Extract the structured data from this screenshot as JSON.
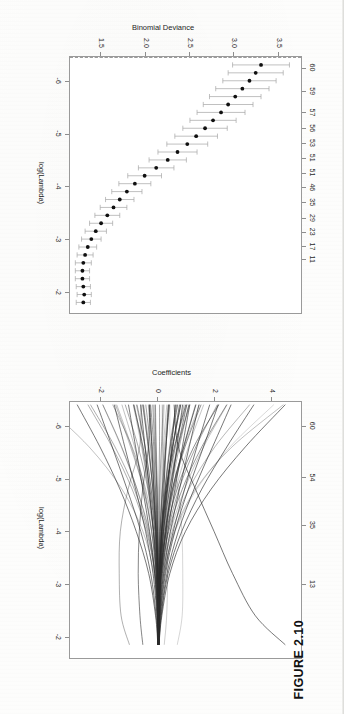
{
  "caption": "FIGURE 2.10",
  "panels": {
    "coefficient_path": {
      "name": "lasso-coefficient-path",
      "xlabel": "log(Lambda)",
      "ylabel": "Coefficients",
      "x_ticks": [
        "-2",
        "-3",
        "-4",
        "-5",
        "-6"
      ],
      "y_ticks": [
        "4",
        "2",
        "0",
        "-2"
      ],
      "top_ticks": [
        "1",
        "13",
        "35",
        "54",
        "60"
      ]
    },
    "cv_curve": {
      "name": "cross-validation-curve",
      "xlabel": "log(Lambda)",
      "ylabel": "Binomial Deviance",
      "x_ticks": [
        "-2",
        "-3",
        "-4",
        "-5",
        "-6"
      ],
      "y_ticks": [
        "3.5",
        "3.0",
        "2.5",
        "2.0",
        "1.5"
      ],
      "top_ticks": [
        "1",
        "4",
        "6",
        "7",
        "11",
        "17",
        "23",
        "29",
        "35",
        "46",
        "51",
        "51",
        "53",
        "56",
        "57",
        "59",
        "60"
      ]
    }
  },
  "chart_data": [
    {
      "type": "line",
      "title": "",
      "xlabel": "log(Lambda)",
      "ylabel": "Coefficients",
      "xlim": [
        -6.45,
        -1.6
      ],
      "ylim": [
        -3.1,
        5.0
      ],
      "grid": false,
      "legend": null,
      "top_axis": {
        "label": "Degrees of Freedom (non-zero coefficients)",
        "tick_positions": [
          -1.85,
          -3.0,
          -4.12,
          -5.02,
          -6.0
        ],
        "tick_labels": [
          "1",
          "13",
          "35",
          "54",
          "60"
        ]
      },
      "x_ticks": [
        -2,
        -3,
        -4,
        -5,
        -6
      ],
      "y_ticks": [
        4,
        2,
        0,
        -2
      ],
      "description": "Lasso regularization paths: 60+ coefficient trajectories converging to zero as log(Lambda) increases.",
      "series": [
        {
          "name": "c1",
          "x": [
            -6.4,
            -5.6,
            -4.8,
            -4.0,
            -3.2,
            -2.4,
            -1.85
          ],
          "values": [
            4.45,
            3.05,
            1.85,
            0.95,
            0.4,
            0.12,
            0.02
          ]
        },
        {
          "name": "c2",
          "x": [
            -6.4,
            -5.6,
            -4.8,
            -4.0,
            -3.2,
            -2.4,
            -1.85
          ],
          "values": [
            3.35,
            2.4,
            1.52,
            0.82,
            0.34,
            0.1,
            0.02
          ]
        },
        {
          "name": "c3",
          "x": [
            -6.4,
            -5.6,
            -4.8,
            -4.0,
            -3.2,
            -2.4,
            -1.85
          ],
          "values": [
            2.55,
            1.9,
            1.25,
            0.7,
            0.3,
            0.09,
            0.01
          ]
        },
        {
          "name": "c4",
          "x": [
            -6.4,
            -5.6,
            -4.8,
            -4.0,
            -3.2,
            -2.4,
            -1.85
          ],
          "values": [
            2.1,
            1.58,
            1.05,
            0.58,
            0.25,
            0.07,
            0.01
          ]
        },
        {
          "name": "c5",
          "x": [
            -6.4,
            -5.6,
            -4.8,
            -4.0,
            -3.2,
            -2.4,
            -1.85
          ],
          "values": [
            1.8,
            1.35,
            0.92,
            0.52,
            0.22,
            0.06,
            0.01
          ]
        },
        {
          "name": "c6",
          "x": [
            -6.4,
            -5.6,
            -4.8,
            -4.0,
            -3.2,
            -2.4,
            -1.85
          ],
          "values": [
            1.42,
            1.08,
            0.74,
            0.42,
            0.18,
            0.05,
            0.01
          ]
        },
        {
          "name": "c7",
          "x": [
            -6.4,
            -5.6,
            -4.8,
            -4.0,
            -3.2,
            -2.4,
            -1.85
          ],
          "values": [
            1.1,
            0.84,
            0.58,
            0.33,
            0.14,
            0.04,
            0.0
          ]
        },
        {
          "name": "c8",
          "x": [
            -6.4,
            -5.6,
            -4.8,
            -4.0,
            -3.2,
            -2.4,
            -1.85
          ],
          "values": [
            0.85,
            0.65,
            0.45,
            0.26,
            0.11,
            0.03,
            0.0
          ]
        },
        {
          "name": "c9",
          "x": [
            -6.4,
            -5.6,
            -4.8,
            -4.0,
            -3.2,
            -2.4,
            -1.85
          ],
          "values": [
            0.6,
            0.46,
            0.32,
            0.18,
            0.08,
            0.02,
            0.0
          ]
        },
        {
          "name": "c10",
          "x": [
            -6.4,
            -5.6,
            -4.8,
            -4.0,
            -3.2,
            -2.4,
            -1.85
          ],
          "values": [
            0.35,
            0.27,
            0.19,
            0.11,
            0.05,
            0.01,
            0.0
          ]
        },
        {
          "name": "c11",
          "x": [
            -6.4,
            -5.6,
            -4.8,
            -4.0,
            -3.2,
            -2.4,
            -1.85
          ],
          "values": [
            0.55,
            0.7,
            1.3,
            1.95,
            2.6,
            3.4,
            4.45
          ]
        },
        {
          "name": "c12",
          "x": [
            -6.4,
            -5.6,
            -4.8,
            -4.0,
            -3.2,
            -2.4,
            -1.85
          ],
          "values": [
            -2.85,
            -2.05,
            -1.35,
            -0.78,
            -0.34,
            -0.1,
            -0.02
          ]
        },
        {
          "name": "c13",
          "x": [
            -6.4,
            -5.6,
            -4.8,
            -4.0,
            -3.2,
            -2.4,
            -1.85
          ],
          "values": [
            -2.15,
            -1.62,
            -1.1,
            -0.62,
            -0.27,
            -0.08,
            -0.01
          ]
        },
        {
          "name": "c14",
          "x": [
            -6.4,
            -5.6,
            -4.8,
            -4.0,
            -3.2,
            -2.4,
            -1.85
          ],
          "values": [
            -1.55,
            -1.18,
            -0.8,
            -0.45,
            -0.19,
            -0.05,
            -0.01
          ]
        },
        {
          "name": "c15",
          "x": [
            -6.4,
            -5.6,
            -4.8,
            -4.0,
            -3.2,
            -2.4,
            -1.85
          ],
          "values": [
            -1.05,
            -0.8,
            -0.55,
            -0.31,
            -0.13,
            -0.04,
            -0.01
          ]
        },
        {
          "name": "c16",
          "x": [
            -6.4,
            -5.6,
            -4.8,
            -4.0,
            -3.2,
            -2.4,
            -1.85
          ],
          "values": [
            -0.62,
            -0.47,
            -0.32,
            -0.18,
            -0.08,
            -0.02,
            0.0
          ]
        },
        {
          "name": "c17",
          "x": [
            -6.4,
            -5.6,
            -4.8,
            -4.0,
            -3.2,
            -2.4,
            -1.85
          ],
          "values": [
            -0.3,
            -0.23,
            -0.16,
            -0.09,
            -0.04,
            -0.01,
            0.0
          ]
        }
      ]
    },
    {
      "type": "line",
      "title": "",
      "xlabel": "log(Lambda)",
      "ylabel": "Binomial Deviance",
      "xlim": [
        -6.45,
        -1.6
      ],
      "ylim": [
        1.15,
        3.75
      ],
      "grid": false,
      "legend": null,
      "error_bars": true,
      "top_axis": {
        "label": "Degrees of Freedom (non-zero coefficients)",
        "tick_labels": [
          "1",
          "4",
          "6",
          "7",
          "11",
          "17",
          "23",
          "29",
          "35",
          "46",
          "51",
          "51",
          "53",
          "56",
          "57",
          "59",
          "60"
        ],
        "tick_positions": [
          -1.78,
          -1.98,
          -2.18,
          -2.38,
          -2.62,
          -2.86,
          -3.14,
          -3.4,
          -3.7,
          -3.98,
          -4.26,
          -4.54,
          -4.82,
          -5.1,
          -5.4,
          -5.8,
          -6.25
        ]
      },
      "x_ticks": [
        -2,
        -3,
        -4,
        -5,
        -6
      ],
      "y_ticks": [
        3.5,
        3.0,
        2.5,
        2.0,
        1.5
      ],
      "vertical_lines": [
        {
          "name": "lambda.min",
          "x": -1.78,
          "style": "dashed"
        },
        {
          "name": "lambda.1se",
          "x": -2.6,
          "style": "dashed"
        }
      ],
      "x": [
        -6.3,
        -6.15,
        -6.0,
        -5.85,
        -5.7,
        -5.55,
        -5.4,
        -5.25,
        -5.1,
        -4.95,
        -4.8,
        -4.65,
        -4.5,
        -4.35,
        -4.2,
        -4.05,
        -3.9,
        -3.75,
        -3.6,
        -3.45,
        -3.3,
        -3.15,
        -3.0,
        -2.85,
        -2.7,
        -2.55,
        -2.4,
        -2.25,
        -2.1,
        -1.95,
        -1.8
      ],
      "values": [
        3.3,
        3.24,
        3.17,
        3.09,
        3.01,
        2.93,
        2.85,
        2.76,
        2.67,
        2.57,
        2.47,
        2.36,
        2.25,
        2.12,
        1.99,
        1.88,
        1.79,
        1.71,
        1.64,
        1.57,
        1.5,
        1.44,
        1.39,
        1.35,
        1.32,
        1.3,
        1.29,
        1.29,
        1.3,
        1.31,
        1.3
      ],
      "upper": [
        3.62,
        3.55,
        3.47,
        3.39,
        3.3,
        3.21,
        3.12,
        3.02,
        2.92,
        2.81,
        2.7,
        2.58,
        2.46,
        2.32,
        2.18,
        2.06,
        1.96,
        1.87,
        1.79,
        1.71,
        1.63,
        1.56,
        1.5,
        1.45,
        1.41,
        1.39,
        1.37,
        1.37,
        1.38,
        1.39,
        1.38
      ],
      "lower": [
        2.98,
        2.93,
        2.87,
        2.79,
        2.72,
        2.65,
        2.58,
        2.5,
        2.42,
        2.33,
        2.24,
        2.14,
        2.04,
        1.92,
        1.8,
        1.7,
        1.62,
        1.55,
        1.49,
        1.43,
        1.37,
        1.32,
        1.28,
        1.25,
        1.23,
        1.21,
        1.21,
        1.21,
        1.22,
        1.23,
        1.22
      ]
    }
  ]
}
